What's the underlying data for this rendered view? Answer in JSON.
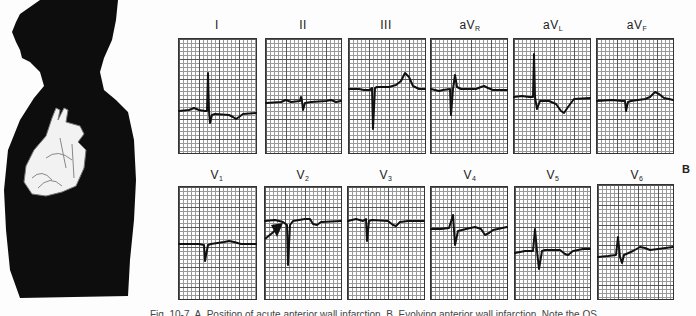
{
  "figure": {
    "panel_tag": "B",
    "caption": "Fig. 10-7. A, Position of acute anterior wall infarction. B, Evolving anterior wall infarction. Note the QS",
    "illustration": "human-torso-silhouette-with-heart"
  },
  "leads": {
    "row1": [
      {
        "id": "I",
        "label": "I",
        "sub": ""
      },
      {
        "id": "II",
        "label": "II",
        "sub": ""
      },
      {
        "id": "III",
        "label": "III",
        "sub": ""
      },
      {
        "id": "aVR",
        "label": "aV",
        "sub": "R"
      },
      {
        "id": "aVL",
        "label": "aV",
        "sub": "L"
      },
      {
        "id": "aVF",
        "label": "aV",
        "sub": "F"
      }
    ],
    "row2": [
      {
        "id": "V1",
        "label": "V",
        "sub": "1"
      },
      {
        "id": "V2",
        "label": "V",
        "sub": "2"
      },
      {
        "id": "V3",
        "label": "V",
        "sub": "3"
      },
      {
        "id": "V4",
        "label": "V",
        "sub": "4"
      },
      {
        "id": "V5",
        "label": "V",
        "sub": "5"
      },
      {
        "id": "V6",
        "label": "V",
        "sub": "6"
      }
    ]
  },
  "annotations": {
    "v2_arrow": "arrow pointing to QS complex in lead V2"
  }
}
